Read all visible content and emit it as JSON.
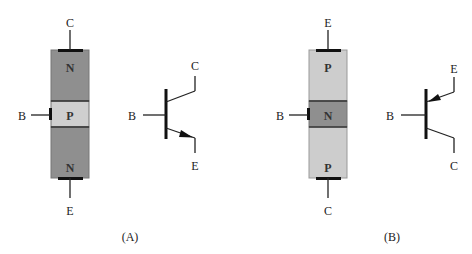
{
  "figure": {
    "panel_a": {
      "caption": "(A)",
      "type": "NPN",
      "layers": [
        {
          "label": "N",
          "color": "#8f8f8f"
        },
        {
          "label": "P",
          "color": "#cfcfcf"
        },
        {
          "label": "N",
          "color": "#8f8f8f"
        }
      ],
      "terminals": {
        "top": "C",
        "base": "B",
        "bottom": "E"
      },
      "symbol": {
        "collector": "C",
        "base": "B",
        "emitter": "E"
      }
    },
    "panel_b": {
      "caption": "(B)",
      "type": "PNP",
      "layers": [
        {
          "label": "P",
          "color": "#cdcdcd"
        },
        {
          "label": "N",
          "color": "#8f8f8f"
        },
        {
          "label": "P",
          "color": "#cdcdcd"
        }
      ],
      "terminals": {
        "top": "E",
        "base": "B",
        "bottom": "C"
      },
      "symbol": {
        "emitter": "E",
        "base": "B",
        "collector": "C"
      }
    }
  }
}
